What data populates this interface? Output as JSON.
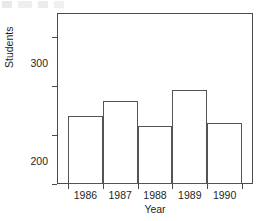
{
  "chart_data": {
    "type": "bar",
    "title": "",
    "xlabel": "Year",
    "ylabel": "Students",
    "categories": [
      "1986",
      "1987",
      "1988",
      "1989",
      "1990"
    ],
    "values": [
      140,
      170,
      118,
      192,
      125
    ],
    "ylim": [
      0,
      350
    ],
    "yticks": [
      0,
      100,
      200,
      300
    ],
    "ytick_labels": [
      "0",
      "100",
      "200",
      "300"
    ],
    "grid": false,
    "legend": null,
    "bar_style": {
      "fill": "#ffffff",
      "edge": "#545454",
      "adjacent": true
    },
    "axis_color": "#4a4a4a",
    "background": "#ffffff"
  }
}
